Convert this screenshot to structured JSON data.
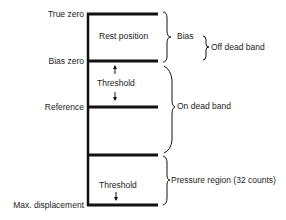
{
  "left_labels": {
    "true_zero": "True zero",
    "bias_zero": "Bias zero",
    "reference": "Reference",
    "max_displacement": "Max. displacement"
  },
  "inner_labels": {
    "rest_position": "Rest position",
    "threshold_upper": "Threshold",
    "threshold_lower": "Threshold"
  },
  "brace_labels": {
    "bias": "Bias",
    "off_dead_band": "Off dead band",
    "on_dead_band": "On dead band",
    "pressure_region": "Pressure region (32 counts)"
  },
  "colors": {
    "line": "#111111",
    "text": "#222222"
  }
}
